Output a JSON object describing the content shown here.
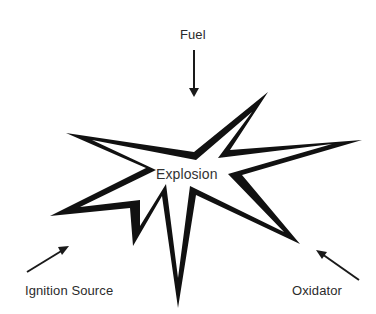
{
  "diagram": {
    "center_label": "Explosion",
    "inputs": [
      {
        "id": "fuel",
        "label": "Fuel",
        "position": "top"
      },
      {
        "id": "ignition",
        "label": "Ignition Source",
        "position": "bottom-left"
      },
      {
        "id": "oxidator",
        "label": "Oxidator",
        "position": "bottom-right"
      }
    ],
    "colors": {
      "star_outline": "#111111",
      "star_fill": "#ffffff",
      "arrow": "#1a1a1a",
      "text": "#2b2b2b"
    }
  }
}
